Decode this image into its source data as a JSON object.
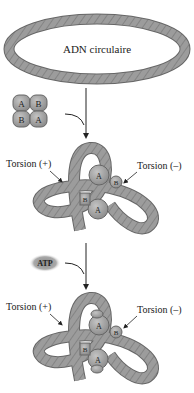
{
  "diagram": {
    "title_ring": "ADN circulaire",
    "enzyme_subunits": [
      "A",
      "B",
      "B",
      "A"
    ],
    "step1": {
      "label_left": "Torsion (+)",
      "label_right": "Torsion (–)",
      "subunits": [
        "A",
        "B",
        "B",
        "A"
      ]
    },
    "cofactor": "ATP",
    "step2": {
      "label_left": "Torsion (+)",
      "label_right": "Torsion (–)",
      "subunits": [
        "A",
        "B",
        "B",
        "A"
      ]
    }
  },
  "colors": {
    "dna_fill": "#9a9a9a",
    "dna_stroke": "#6b6b6b",
    "dna_hatch": "#7d7d7d",
    "protein_fill": "#a8a8a8",
    "protein_stroke": "#6a6a6a",
    "text": "#222222",
    "atp_fill": "#8e8e8e"
  }
}
